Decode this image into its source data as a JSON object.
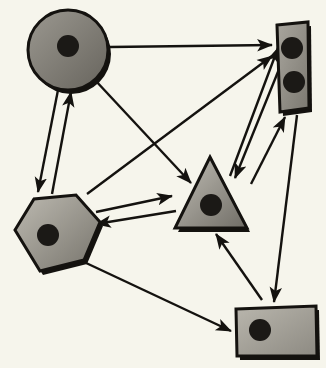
{
  "diagram": {
    "canvas": {
      "width": 326,
      "height": 368
    },
    "background_color": "#f6f5ec",
    "style": {
      "node_stroke_color": "#14120f",
      "node_stroke_width": 3,
      "node_fill_light": "#b3b0a8",
      "node_fill_dark": "#6d6a63",
      "marker_dot_color": "#1b1916",
      "arrow_color": "#14120f",
      "arrow_width": 2.4,
      "shadow_color": "#14120f"
    },
    "nodes": [
      {
        "id": "circle-node",
        "name": "circle-node",
        "shape": "circle",
        "label": "Circle",
        "cx": 68,
        "cy": 50,
        "r": 40,
        "fill_light": "#9b9890",
        "fill_dark": "#67645d",
        "dots": [
          {
            "cx": 68,
            "cy": 46,
            "r": 11
          }
        ]
      },
      {
        "id": "hexagon-node",
        "name": "hexagon-node",
        "shape": "hexagon",
        "label": "Hexagon",
        "points": "15,230 34,199 76,195 100,222 84,260 40,271",
        "fill_light": "#bdbab1",
        "fill_dark": "#77746c",
        "dots": [
          {
            "cx": 48,
            "cy": 235,
            "r": 11
          }
        ]
      },
      {
        "id": "triangle-node",
        "name": "triangle-node",
        "shape": "triangle",
        "label": "Triangle",
        "points": "210,157 247,228 175,228",
        "fill_light": "#c2bfb6",
        "fill_dark": "#706d66",
        "dots": [
          {
            "cx": 211,
            "cy": 205,
            "r": 11
          }
        ]
      },
      {
        "id": "tall-rect-node",
        "name": "tall-rectangle-node",
        "shape": "rectangle",
        "label": "Tall rectangle",
        "points": "277,25 308,22 309,108 280,112",
        "fill_light": "#a9a69e",
        "fill_dark": "#7b7870",
        "dots": [
          {
            "cx": 292,
            "cy": 48,
            "r": 11
          },
          {
            "cx": 294,
            "cy": 82,
            "r": 11
          }
        ]
      },
      {
        "id": "wide-rect-node",
        "name": "wide-rectangle-node",
        "shape": "rectangle",
        "label": "Wide rectangle",
        "points": "236,309 316,306 317,356 237,356",
        "fill_light": "#b9b6ad",
        "fill_dark": "#8d8a82",
        "dots": [
          {
            "cx": 260,
            "cy": 330,
            "r": 11
          }
        ]
      }
    ],
    "edges": [
      {
        "id": "edge-circle-to-tall-rect",
        "name": "edge-circle-to-tall-rectangle",
        "from": "circle-node",
        "to": "tall-rect-node",
        "x1": 110,
        "y1": 47,
        "x2": 272,
        "y2": 45,
        "directed": true
      },
      {
        "id": "edge-circle-to-triangle",
        "name": "edge-circle-to-triangle",
        "from": "circle-node",
        "to": "triangle-node",
        "x1": 95,
        "y1": 80,
        "x2": 191,
        "y2": 183,
        "directed": true
      },
      {
        "id": "edge-circle-to-hexagon",
        "name": "edge-circle-to-hexagon",
        "from": "circle-node",
        "to": "hexagon-node",
        "x1": 58,
        "y1": 90,
        "x2": 38,
        "y2": 192,
        "directed": true
      },
      {
        "id": "edge-hexagon-to-circle",
        "name": "edge-hexagon-to-circle",
        "from": "hexagon-node",
        "to": "circle-node",
        "x1": 52,
        "y1": 194,
        "x2": 71,
        "y2": 92,
        "directed": true
      },
      {
        "id": "edge-hexagon-to-tall-rect",
        "name": "edge-hexagon-to-tall-rectangle",
        "from": "hexagon-node",
        "to": "tall-rect-node",
        "x1": 87,
        "y1": 194,
        "x2": 272,
        "y2": 56,
        "directed": true
      },
      {
        "id": "edge-hexagon-to-triangle",
        "name": "edge-hexagon-to-triangle",
        "from": "hexagon-node",
        "to": "triangle-node",
        "x1": 96,
        "y1": 212,
        "x2": 172,
        "y2": 196,
        "directed": true
      },
      {
        "id": "edge-triangle-to-hexagon",
        "name": "edge-triangle-to-hexagon",
        "from": "triangle-node",
        "to": "hexagon-node",
        "x1": 176,
        "y1": 211,
        "x2": 96,
        "y2": 224,
        "directed": true
      },
      {
        "id": "edge-hexagon-to-wide-rect",
        "name": "edge-hexagon-to-wide-rectangle",
        "from": "hexagon-node",
        "to": "wide-rect-node",
        "x1": 84,
        "y1": 262,
        "x2": 231,
        "y2": 331,
        "directed": true
      },
      {
        "id": "edge-triangle-to-tall-rect",
        "name": "edge-triangle-to-tall-rectangle",
        "from": "triangle-node",
        "to": "tall-rect-node",
        "x1": 230,
        "y1": 176,
        "x2": 278,
        "y2": 48,
        "directed": true
      },
      {
        "id": "edge-tall-rect-to-triangle",
        "name": "edge-tall-rectangle-to-triangle",
        "from": "tall-rect-node",
        "to": "triangle-node",
        "x1": 286,
        "y1": 52,
        "x2": 235,
        "y2": 178,
        "directed": true
      },
      {
        "id": "edge-wide-rect-to-tall-rect",
        "name": "edge-wide-rectangle-to-tall-rectangle",
        "from": "wide-rect-node",
        "to": "tall-rect-node",
        "x1": 251,
        "y1": 184,
        "x2": 285,
        "y2": 117,
        "directed": true
      },
      {
        "id": "edge-tall-rect-to-wide-rect",
        "name": "edge-tall-rectangle-to-wide-rectangle",
        "from": "tall-rect-node",
        "to": "wide-rect-node",
        "x1": 297,
        "y1": 115,
        "x2": 274,
        "y2": 302,
        "directed": true
      },
      {
        "id": "edge-wide-rect-to-triangle",
        "name": "edge-wide-rectangle-to-triangle",
        "from": "wide-rect-node",
        "to": "triangle-node",
        "x1": 262,
        "y1": 300,
        "x2": 216,
        "y2": 234,
        "directed": true
      }
    ]
  }
}
